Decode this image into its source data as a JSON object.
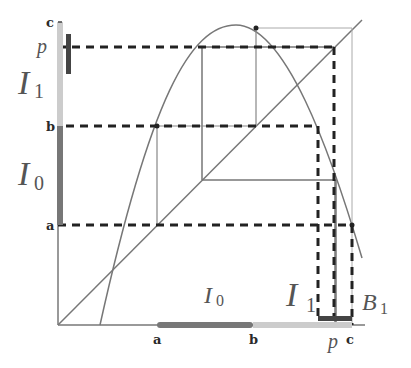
{
  "diagram": {
    "type": "cobweb / logistic map interval diagram",
    "colors": {
      "curve": "#666666",
      "thin_line": "#777777",
      "dashed": "#222222",
      "I0_bar": "#777777",
      "I1_bar": "#cccccc",
      "B1_bar": "#444444"
    },
    "y_axis_labels": {
      "c": "c",
      "p": "p",
      "b": "b",
      "a": "a"
    },
    "x_axis_labels": {
      "a": "a",
      "b": "b",
      "p": "p",
      "c": "c"
    },
    "interval_labels": {
      "I1_left": {
        "main": "I",
        "sub": "1"
      },
      "I0_left": {
        "main": "I",
        "sub": "0"
      },
      "I0_bottom": {
        "main": "I",
        "sub": "0"
      },
      "I1_bottom": {
        "main": "I",
        "sub": "1"
      },
      "B1_bottom": {
        "main": "B",
        "sub": "1"
      }
    }
  }
}
